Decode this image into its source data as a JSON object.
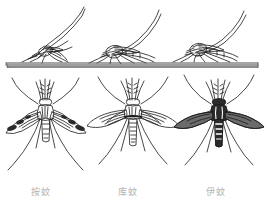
{
  "figure": {
    "background_color": "#ffffff",
    "ink_color": "#1a1a1a",
    "label_color": "#b3b3b3",
    "bar_color": "#808080"
  },
  "surface_bar": {
    "name": "resting-surface-bar",
    "x_start": 6,
    "x_end": 258,
    "y": 62,
    "thickness": 4
  },
  "labels": {
    "anopheles": "按蚊",
    "culex": "库蚊",
    "aedes": "伊蚊"
  },
  "specimens": [
    {
      "genus_label": "按蚊",
      "resting_posture": "angled",
      "wings": "spotted",
      "abdomen": "banded",
      "column": 1
    },
    {
      "genus_label": "库蚊",
      "resting_posture": "parallel",
      "wings": "plain",
      "abdomen": "banded",
      "column": 2
    },
    {
      "genus_label": "伊蚊",
      "resting_posture": "parallel",
      "wings": "dark-mottled",
      "abdomen": "dark-with-white-bands",
      "column": 3
    }
  ]
}
